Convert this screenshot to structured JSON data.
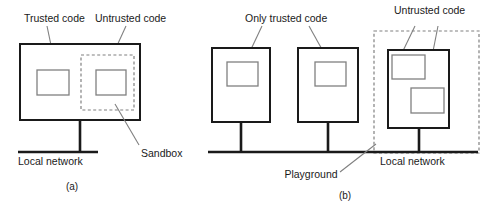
{
  "figure": {
    "background_color": "#ffffff",
    "stroke_color": "#1a1a1a",
    "accent_color": "#808080"
  },
  "panel_a": {
    "caption": "(a)",
    "labels": {
      "trusted_code": "Trusted code",
      "untrusted_code": "Untrusted code",
      "sandbox": "Sandbox",
      "local_network": "Local network"
    }
  },
  "panel_b": {
    "caption": "(b)",
    "labels": {
      "only_trusted_code": "Only trusted code",
      "untrusted_code": "Untrusted code",
      "playground": "Playground",
      "local_network": "Local network"
    }
  }
}
